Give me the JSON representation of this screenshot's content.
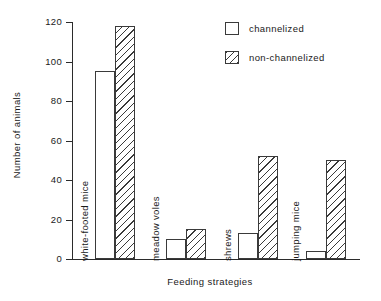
{
  "chart_data": {
    "type": "bar",
    "title": "",
    "xlabel": "Feeding strategies",
    "ylabel": "Number of animals",
    "categories": [
      "white-footed mice",
      "meadow voles",
      "shrews",
      "jumping mice"
    ],
    "series": [
      {
        "name": "channelized",
        "values": [
          95,
          10,
          13,
          4
        ],
        "fill": "empty"
      },
      {
        "name": "non-channelized",
        "values": [
          118,
          15,
          52,
          50
        ],
        "fill": "diagonal-hatch"
      }
    ],
    "ylim": [
      0,
      120
    ],
    "yticks": [
      0,
      20,
      40,
      60,
      80,
      100,
      120
    ],
    "ytick_labels": [
      "0",
      "20",
      "40",
      "60",
      "80",
      "100",
      "120"
    ],
    "grid": false,
    "legend_position": "top-right",
    "line_color": "#3a3a3a",
    "background_color": "#ffffff"
  },
  "legend": {
    "items": [
      {
        "label": "channelized"
      },
      {
        "label": "non-channelized"
      }
    ]
  }
}
